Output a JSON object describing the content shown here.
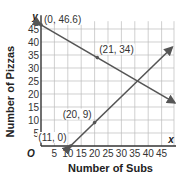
{
  "chart_data": {
    "type": "line",
    "title": "",
    "xlabel": "Number of Subs",
    "ylabel": "Number of Pizzas",
    "x_var": "x",
    "y_var": "y",
    "origin_label": "O",
    "xlim": [
      0,
      50
    ],
    "ylim": [
      0,
      48
    ],
    "x_ticks": [
      5,
      10,
      15,
      20,
      25,
      30,
      35,
      40,
      45
    ],
    "y_ticks": [
      5,
      10,
      15,
      20,
      25,
      30,
      35,
      40,
      45
    ],
    "grid": true,
    "series": [
      {
        "name": "decreasing line",
        "points": [
          [
            0,
            46.6
          ],
          [
            21,
            34
          ],
          [
            50,
            16.6
          ]
        ],
        "labeled_points": [
          {
            "x": 0,
            "y": 46.6,
            "label": "(0, 46.6)"
          },
          {
            "x": 21,
            "y": 34,
            "label": "(21, 34)"
          }
        ]
      },
      {
        "name": "increasing line",
        "points": [
          [
            11,
            0
          ],
          [
            20,
            9
          ],
          [
            49,
            38
          ]
        ],
        "labeled_points": [
          {
            "x": 11,
            "y": 0,
            "label": "(11, 0)"
          },
          {
            "x": 20,
            "y": 9,
            "label": "(20, 9)"
          }
        ]
      }
    ],
    "colors": {
      "line": "#555555",
      "grid": "#bbbbbb",
      "axis": "#333333"
    }
  }
}
